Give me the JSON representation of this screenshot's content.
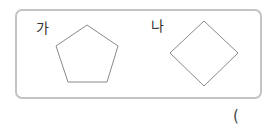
{
  "figures": [
    {
      "label": "가",
      "shape": "pentagon",
      "stroke": "#888888"
    },
    {
      "label": "나",
      "shape": "square-rotated",
      "stroke": "#888888"
    }
  ],
  "answer": {
    "open_paren": "("
  }
}
